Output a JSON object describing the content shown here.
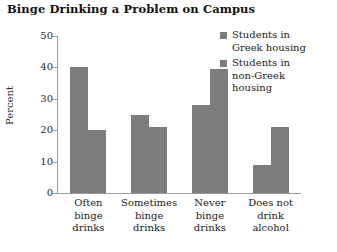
{
  "chart_data": {
    "type": "bar",
    "title": "Binge Drinking a Problem on Campus",
    "xlabel": "",
    "ylabel": "Percent",
    "ylim": [
      0,
      50
    ],
    "yticks": [
      0,
      10,
      20,
      30,
      40,
      50
    ],
    "grid": false,
    "legend_position": "top-right",
    "categories": [
      "Often binge drinks",
      "Sometimes binge drinks",
      "Never binge drinks",
      "Does not drink alcohol"
    ],
    "category_lines": [
      [
        "Often",
        "binge",
        "drinks"
      ],
      [
        "Sometimes",
        "binge",
        "drinks"
      ],
      [
        "Never",
        "binge",
        "drinks"
      ],
      [
        "Does not",
        "drink",
        "alcohol"
      ]
    ],
    "series": [
      {
        "name": "Students in Greek housing",
        "name_lines": [
          "Students in",
          "Greek housing"
        ],
        "color": "#7c7c7c",
        "values": [
          40,
          25,
          28,
          9
        ]
      },
      {
        "name": "Students in non-Greek housing",
        "name_lines": [
          "Students in",
          "non-Greek",
          "housing"
        ],
        "color": "#7c7c7c",
        "values": [
          20,
          21,
          39.5,
          21
        ]
      }
    ]
  },
  "axis": {
    "y_tick_labels": [
      "50",
      "40",
      "30",
      "20",
      "10",
      "0"
    ],
    "y_axis_title": "Percent"
  },
  "colors": {
    "bar_fill": "#7c7c7c",
    "axis_line": "#9a9a9a",
    "title_text": "#111111",
    "label_text": "#222222",
    "background": "#ffffff"
  }
}
